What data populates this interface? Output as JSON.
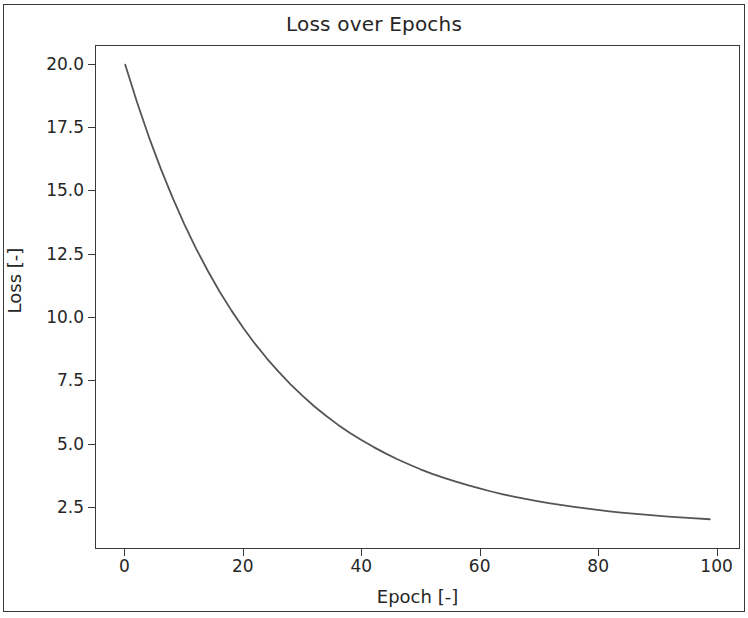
{
  "chart_data": {
    "type": "line",
    "title": "Loss over Epochs",
    "xlabel": "Epoch [-]",
    "ylabel": "Loss [-]",
    "xlim": [
      -4.95,
      103.95
    ],
    "ylim": [
      0.84,
      20.74
    ],
    "grid": false,
    "legend": null,
    "xticks": [
      0,
      20,
      40,
      60,
      80,
      100
    ],
    "xticklabels": [
      "0",
      "20",
      "40",
      "60",
      "80",
      "100"
    ],
    "yticks": [
      2.5,
      5.0,
      7.5,
      10.0,
      12.5,
      15.0,
      17.5,
      20.0
    ],
    "yticklabels": [
      "2.5",
      "5.0",
      "7.5",
      "10.0",
      "12.5",
      "15.0",
      "17.5",
      "20.0"
    ],
    "line_color": "#555555",
    "line_width": 1.8,
    "series": [
      {
        "name": "loss",
        "x": [
          0,
          2,
          4,
          6,
          8,
          10,
          12,
          14,
          16,
          18,
          20,
          22,
          24,
          26,
          28,
          30,
          32,
          34,
          36,
          38,
          40,
          42,
          44,
          46,
          48,
          50,
          52,
          54,
          56,
          58,
          60,
          62,
          64,
          66,
          68,
          70,
          72,
          74,
          76,
          78,
          80,
          82,
          84,
          86,
          88,
          90,
          92,
          94,
          96,
          99
        ],
        "values": [
          20.0,
          18.51,
          17.14,
          15.89,
          14.74,
          13.68,
          12.71,
          11.82,
          11.0,
          10.25,
          9.56,
          8.93,
          8.35,
          7.82,
          7.33,
          6.88,
          6.46,
          6.08,
          5.73,
          5.41,
          5.12,
          4.85,
          4.6,
          4.37,
          4.16,
          3.96,
          3.78,
          3.62,
          3.47,
          3.33,
          3.2,
          3.08,
          2.97,
          2.87,
          2.78,
          2.69,
          2.61,
          2.54,
          2.47,
          2.41,
          2.35,
          2.29,
          2.24,
          2.2,
          2.16,
          2.12,
          2.08,
          2.05,
          2.02,
          1.98
        ]
      }
    ]
  },
  "figure": {
    "background": "#ffffff",
    "frame_color": "#3a3a3a"
  }
}
